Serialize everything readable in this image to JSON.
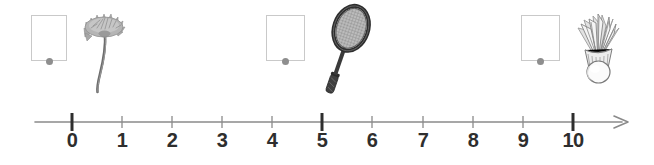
{
  "worksheet": {
    "title": "Number line with picture counting boxes",
    "background_color": "#ffffff"
  },
  "colors": {
    "box_border": "#c9c9c9",
    "box_fill": "#ffffff",
    "dot": "#8e8e8e",
    "axis_line": "#8a8a8a",
    "tick_minor": "#8a8a8a",
    "tick_major": "#2e2e2e",
    "label_text": "#2e2e2e",
    "art_dark": "#4a4a4a",
    "art_mid": "#8d8d8d",
    "art_light": "#c4c4c4"
  },
  "answer_boxes": [
    {
      "id": "box-1",
      "label": "",
      "placeholder": "",
      "value": "",
      "x": 31,
      "y": 15,
      "width": 36,
      "height": 46
    },
    {
      "id": "box-2",
      "label": "",
      "placeholder": "",
      "value": "",
      "x": 266,
      "y": 15,
      "width": 39,
      "height": 46
    },
    {
      "id": "box-3",
      "label": "",
      "placeholder": "",
      "value": "",
      "x": 521,
      "y": 15,
      "width": 39,
      "height": 46
    }
  ],
  "pictures": [
    {
      "id": "picture-1",
      "icon": "dandelion-flower-icon",
      "name": "flower",
      "x": 78,
      "y": 6,
      "width": 52,
      "height": 88
    },
    {
      "id": "picture-2",
      "icon": "badminton-racket-icon",
      "name": "badminton racket",
      "x": 314,
      "y": 4,
      "width": 58,
      "height": 96
    },
    {
      "id": "picture-3",
      "icon": "shuttlecock-icon",
      "name": "shuttlecock",
      "x": 569,
      "y": 6,
      "width": 58,
      "height": 84
    }
  ],
  "number_line": {
    "axis_start_x": 35,
    "axis_end_x": 630,
    "axis_y": 22,
    "arrow": "right-arrow-icon",
    "min": 0,
    "max": 10,
    "step": 1,
    "major_ticks": [
      0,
      5,
      10
    ],
    "ticks": [
      {
        "value": 0,
        "label": "0",
        "x": 72,
        "major": true
      },
      {
        "value": 1,
        "label": "1",
        "x": 122,
        "major": false
      },
      {
        "value": 2,
        "label": "2",
        "x": 172,
        "major": false
      },
      {
        "value": 3,
        "label": "3",
        "x": 222,
        "major": false
      },
      {
        "value": 4,
        "label": "4",
        "x": 272,
        "major": false
      },
      {
        "value": 5,
        "label": "5",
        "x": 322,
        "major": true
      },
      {
        "value": 6,
        "label": "6",
        "x": 372,
        "major": false
      },
      {
        "value": 7,
        "label": "7",
        "x": 423,
        "major": false
      },
      {
        "value": 8,
        "label": "8",
        "x": 473,
        "major": false
      },
      {
        "value": 9,
        "label": "9",
        "x": 523,
        "major": false
      },
      {
        "value": 10,
        "label": "10",
        "x": 573,
        "major": true
      }
    ]
  }
}
